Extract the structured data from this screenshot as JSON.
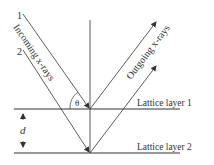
{
  "diagram": {
    "ray_labels": [
      "1",
      "2"
    ],
    "incoming_label": "Incoming x-rays",
    "outgoing_label": "Outgoing x-rays",
    "angle_label": "θ",
    "spacing_label": "d",
    "layers": [
      {
        "label": "Lattice layer 1"
      },
      {
        "label": "Lattice layer 2"
      }
    ],
    "colors": {
      "line": "#333333",
      "background": "#ffffff"
    }
  }
}
